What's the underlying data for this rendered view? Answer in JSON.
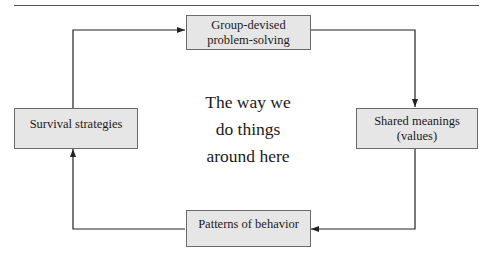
{
  "diagram": {
    "type": "cycle",
    "center_label": [
      "The way we",
      "do things",
      "around here"
    ],
    "nodes": [
      {
        "id": "top",
        "lines": [
          "Group-devised",
          "problem-solving"
        ]
      },
      {
        "id": "right",
        "lines": [
          "Shared meanings",
          "(values)"
        ]
      },
      {
        "id": "bottom",
        "lines": [
          "Patterns of behavior"
        ]
      },
      {
        "id": "left",
        "lines": [
          "Survival strategies"
        ]
      }
    ],
    "edges": [
      {
        "from": "top",
        "to": "right"
      },
      {
        "from": "right",
        "to": "bottom"
      },
      {
        "from": "bottom",
        "to": "left"
      },
      {
        "from": "left",
        "to": "top"
      }
    ],
    "colors": {
      "box_fill": "#e6e6e6",
      "box_border": "#6a6a6a",
      "line": "#222222"
    }
  }
}
